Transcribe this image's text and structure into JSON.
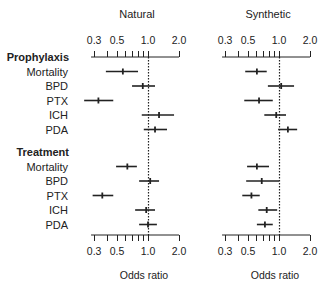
{
  "chart_data": {
    "type": "forest",
    "xscale": "log",
    "xlabel": "Odds ratio",
    "xlim": [
      0.28,
      2.0
    ],
    "xticks_labeled": [
      0.3,
      0.5,
      1.0,
      2.0
    ],
    "xtick_labels": [
      "0.3",
      "0.5",
      "1.0",
      "2.0"
    ],
    "xticks_minor": [
      0.4,
      0.6,
      0.7,
      0.8,
      0.9
    ],
    "reference_line": 1.0,
    "groups": [
      {
        "label": "Prophylaxis",
        "rows": [
          "Mortality",
          "BPD",
          "PTX",
          "ICH",
          "PDA"
        ]
      },
      {
        "label": "Treatment",
        "rows": [
          "Mortality",
          "BPD",
          "PTX",
          "ICH",
          "PDA"
        ]
      }
    ],
    "panels": [
      {
        "title": "Natural",
        "series": [
          {
            "group": "Prophylaxis",
            "outcome": "Mortality",
            "or": 0.57,
            "lo": 0.39,
            "hi": 0.8
          },
          {
            "group": "Prophylaxis",
            "outcome": "BPD",
            "or": 0.89,
            "lo": 0.7,
            "hi": 1.17
          },
          {
            "group": "Prophylaxis",
            "outcome": "PTX",
            "or": 0.33,
            "lo": 0.24,
            "hi": 0.46
          },
          {
            "group": "Prophylaxis",
            "outcome": "ICH",
            "or": 1.28,
            "lo": 0.87,
            "hi": 1.79
          },
          {
            "group": "Prophylaxis",
            "outcome": "PDA",
            "or": 1.17,
            "lo": 0.91,
            "hi": 1.53
          },
          {
            "group": "Treatment",
            "outcome": "Mortality",
            "or": 0.63,
            "lo": 0.49,
            "hi": 0.78
          },
          {
            "group": "Treatment",
            "outcome": "BPD",
            "or": 1.05,
            "lo": 0.82,
            "hi": 1.28
          },
          {
            "group": "Treatment",
            "outcome": "PTX",
            "or": 0.36,
            "lo": 0.29,
            "hi": 0.46
          },
          {
            "group": "Treatment",
            "outcome": "ICH",
            "or": 0.96,
            "lo": 0.75,
            "hi": 1.17
          },
          {
            "group": "Treatment",
            "outcome": "PDA",
            "or": 1.0,
            "lo": 0.82,
            "hi": 1.22
          }
        ]
      },
      {
        "title": "Synthetic",
        "series": [
          {
            "group": "Prophylaxis",
            "outcome": "Mortality",
            "or": 0.61,
            "lo": 0.47,
            "hi": 0.76
          },
          {
            "group": "Prophylaxis",
            "outcome": "BPD",
            "or": 1.05,
            "lo": 0.78,
            "hi": 1.4
          },
          {
            "group": "Prophylaxis",
            "outcome": "PTX",
            "or": 0.64,
            "lo": 0.46,
            "hi": 0.87
          },
          {
            "group": "Prophylaxis",
            "outcome": "ICH",
            "or": 0.94,
            "lo": 0.72,
            "hi": 1.17
          },
          {
            "group": "Prophylaxis",
            "outcome": "PDA",
            "or": 1.22,
            "lo": 0.98,
            "hi": 1.5
          },
          {
            "group": "Treatment",
            "outcome": "Mortality",
            "or": 0.61,
            "lo": 0.49,
            "hi": 0.8
          },
          {
            "group": "Treatment",
            "outcome": "BPD",
            "or": 0.68,
            "lo": 0.48,
            "hi": 1.0
          },
          {
            "group": "Treatment",
            "outcome": "PTX",
            "or": 0.54,
            "lo": 0.44,
            "hi": 0.65
          },
          {
            "group": "Treatment",
            "outcome": "ICH",
            "or": 0.76,
            "lo": 0.63,
            "hi": 0.96
          },
          {
            "group": "Treatment",
            "outcome": "PDA",
            "or": 0.73,
            "lo": 0.61,
            "hi": 0.87
          }
        ]
      }
    ]
  }
}
